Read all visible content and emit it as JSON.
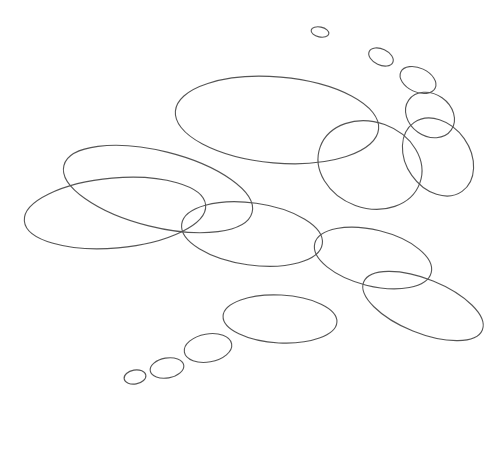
{
  "diagram": {
    "background": "#ffffff",
    "stroke_color": "#555555",
    "ellipses": [
      {
        "id": "bubble-tiny-top",
        "cx": 320,
        "cy": 32,
        "rx": 9,
        "ry": 5,
        "rotation": 12
      },
      {
        "id": "bubble-small-top",
        "cx": 381,
        "cy": 57,
        "rx": 13,
        "ry": 8,
        "rotation": 25
      },
      {
        "id": "bubble-upper-right-1",
        "cx": 418,
        "cy": 80,
        "rx": 19,
        "ry": 12,
        "rotation": 25
      },
      {
        "id": "bubble-upper-right-2",
        "cx": 430,
        "cy": 115,
        "rx": 26,
        "ry": 21,
        "rotation": 35
      },
      {
        "id": "bubble-right-large",
        "cx": 438,
        "cy": 157,
        "rx": 42,
        "ry": 32,
        "rotation": 55
      },
      {
        "id": "cloud-top-large",
        "cx": 277,
        "cy": 120,
        "rx": 102,
        "ry": 43,
        "rotation": 5
      },
      {
        "id": "cloud-mid-right",
        "cx": 370,
        "cy": 165,
        "rx": 53,
        "ry": 43,
        "rotation": 20
      },
      {
        "id": "cloud-left-upper",
        "cx": 158,
        "cy": 189,
        "rx": 97,
        "ry": 38,
        "rotation": 14
      },
      {
        "id": "cloud-left-lower",
        "cx": 115,
        "cy": 213,
        "rx": 91,
        "ry": 35,
        "rotation": -5
      },
      {
        "id": "cloud-center",
        "cx": 252,
        "cy": 234,
        "rx": 71,
        "ry": 31,
        "rotation": 8
      },
      {
        "id": "cloud-right-mid",
        "cx": 373,
        "cy": 258,
        "rx": 60,
        "ry": 28,
        "rotation": 14
      },
      {
        "id": "cloud-right-lower",
        "cx": 423,
        "cy": 306,
        "rx": 64,
        "ry": 27,
        "rotation": 22
      },
      {
        "id": "bubble-lower-large",
        "cx": 280,
        "cy": 319,
        "rx": 57,
        "ry": 24,
        "rotation": 3
      },
      {
        "id": "bubble-lower-medium",
        "cx": 208,
        "cy": 348,
        "rx": 24,
        "ry": 14,
        "rotation": -10
      },
      {
        "id": "bubble-lower-small",
        "cx": 167,
        "cy": 368,
        "rx": 17,
        "ry": 10,
        "rotation": -10
      },
      {
        "id": "bubble-lower-tiny",
        "cx": 135,
        "cy": 377,
        "rx": 11,
        "ry": 7,
        "rotation": -10
      }
    ]
  }
}
